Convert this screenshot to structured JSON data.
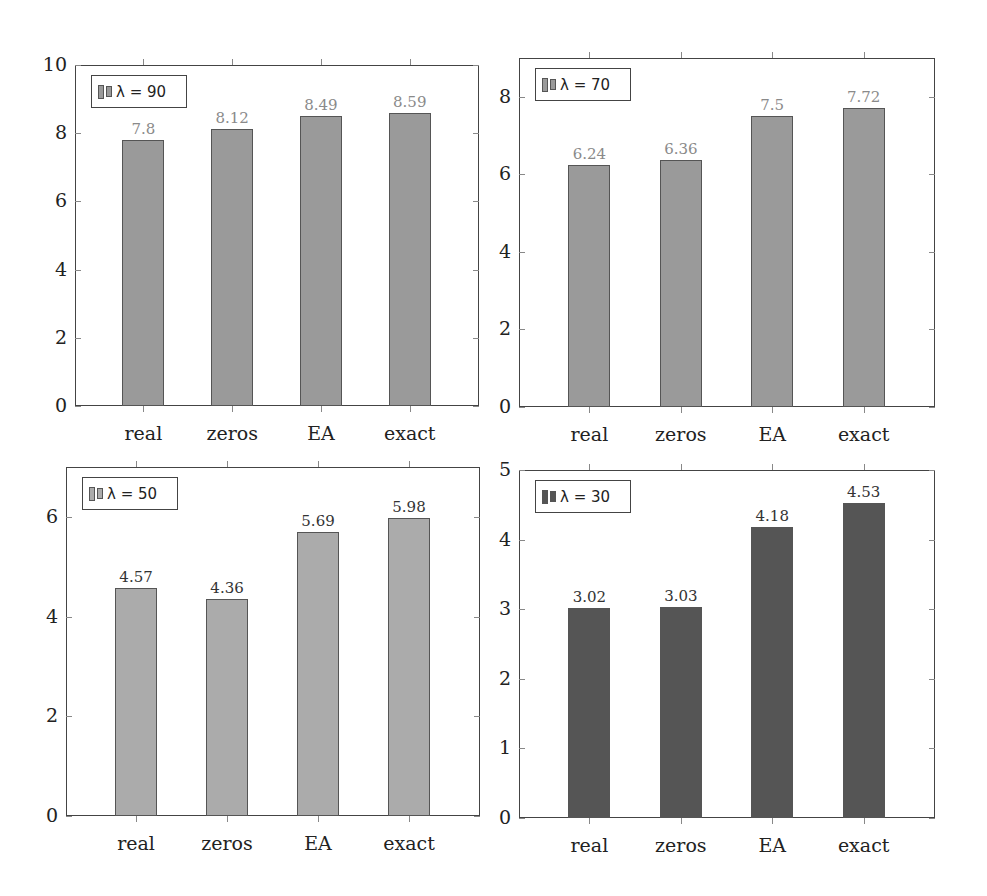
{
  "chart_data": [
    {
      "type": "bar",
      "title": "",
      "legend": "λ = 90",
      "legend_position": "top-left",
      "categories": [
        "real",
        "zeros",
        "EA",
        "exact"
      ],
      "values": [
        7.8,
        8.12,
        8.49,
        8.59
      ],
      "value_labels": [
        "7.8",
        "8.12",
        "8.49",
        "8.59"
      ],
      "xlabel": "",
      "ylabel": "",
      "ylim": [
        0,
        10
      ],
      "yticks": [
        "0",
        "2",
        "4",
        "6",
        "8",
        "10"
      ],
      "grid": false,
      "bar_color": "#9a9a9a",
      "label_color": "#8a8a8a"
    },
    {
      "type": "bar",
      "title": "",
      "legend": "λ = 70",
      "legend_position": "top-left",
      "categories": [
        "real",
        "zeros",
        "EA",
        "exact"
      ],
      "values": [
        6.24,
        6.36,
        7.5,
        7.72
      ],
      "value_labels": [
        "6.24",
        "6.36",
        "7.5",
        "7.72"
      ],
      "xlabel": "",
      "ylabel": "",
      "ylim": [
        0,
        9
      ],
      "yticks": [
        "0",
        "2",
        "4",
        "6",
        "8"
      ],
      "grid": false,
      "bar_color": "#9a9a9a",
      "label_color": "#8a8a8a"
    },
    {
      "type": "bar",
      "title": "",
      "legend": "λ = 50",
      "legend_position": "top-left",
      "categories": [
        "real",
        "zeros",
        "EA",
        "exact"
      ],
      "values": [
        4.57,
        4.36,
        5.69,
        5.98
      ],
      "value_labels": [
        "4.57",
        "4.36",
        "5.69",
        "5.98"
      ],
      "xlabel": "",
      "ylabel": "",
      "ylim": [
        0,
        7
      ],
      "yticks": [
        "0",
        "2",
        "4",
        "6"
      ],
      "grid": false,
      "bar_color": "#ababab",
      "label_color": "#333333"
    },
    {
      "type": "bar",
      "title": "",
      "legend": "λ = 30",
      "legend_position": "top-left",
      "categories": [
        "real",
        "zeros",
        "EA",
        "exact"
      ],
      "values": [
        3.02,
        3.03,
        4.18,
        4.53
      ],
      "value_labels": [
        "3.02",
        "3.03",
        "4.18",
        "4.53"
      ],
      "xlabel": "",
      "ylabel": "",
      "ylim": [
        0,
        5
      ],
      "yticks": [
        "0",
        "1",
        "2",
        "3",
        "4",
        "5"
      ],
      "grid": false,
      "bar_color": "#555555",
      "label_color": "#333333"
    }
  ]
}
